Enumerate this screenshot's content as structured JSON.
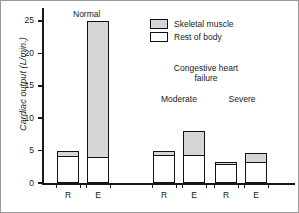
{
  "chart_data": {
    "type": "bar",
    "title": "",
    "xlabel": "",
    "ylabel": "Cardiac output (L/min.)",
    "ylim": [
      0,
      27
    ],
    "yticks": [
      0,
      5,
      10,
      15,
      20,
      25
    ],
    "ytick_labels": [
      "0",
      "5",
      "10",
      "15",
      "20",
      "25"
    ],
    "grid": false,
    "stacked": true,
    "legend_position": "top-right",
    "categories": [
      "R",
      "E",
      "R",
      "E",
      "R",
      "E"
    ],
    "groups": [
      {
        "name": "Normal",
        "bars": [
          "R",
          "E"
        ]
      },
      {
        "name": "Moderate",
        "bars": [
          "R",
          "E"
        ]
      },
      {
        "name": "Severe",
        "bars": [
          "R",
          "E"
        ]
      }
    ],
    "series": [
      {
        "name": "Rest of body",
        "color": "#ffffff",
        "values": [
          4.2,
          4.0,
          4.3,
          4.3,
          2.9,
          3.2
        ]
      },
      {
        "name": "Skeletal muscle",
        "color": "#d6d6d6",
        "values": [
          0.8,
          21.0,
          0.7,
          3.7,
          0.4,
          1.5
        ]
      }
    ],
    "totals": [
      5.0,
      25.0,
      5.0,
      8.0,
      3.3,
      4.7
    ],
    "annotations": [
      {
        "text": "Normal",
        "id": "normal"
      },
      {
        "text": "Congestive heart\nfailure",
        "id": "chf"
      },
      {
        "text": "Moderate",
        "id": "moderate"
      },
      {
        "text": "Severe",
        "id": "severe"
      }
    ]
  },
  "labels": {
    "normal": "Normal",
    "chf_line1": "Congestive heart",
    "chf_line2": "failure",
    "moderate": "Moderate",
    "severe": "Severe",
    "ylabel": "Cardiac output (L/min.)"
  },
  "legend": {
    "items": [
      {
        "label": "Skeletal muscle",
        "color": "#d6d6d6"
      },
      {
        "label": "Rest of body",
        "color": "#ffffff"
      }
    ]
  },
  "colors": {
    "muscle": "#d6d6d6",
    "rest": "#ffffff",
    "ink": "#1a1a1a",
    "frame": "#9a9a9a"
  }
}
